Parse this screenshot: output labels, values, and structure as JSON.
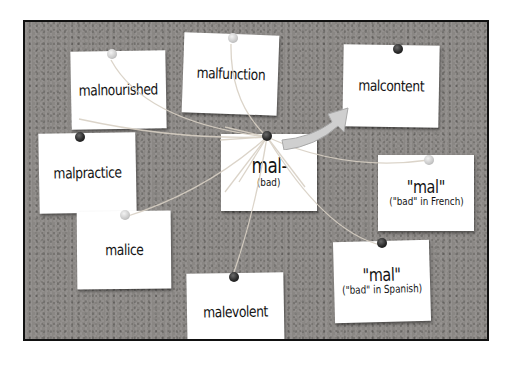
{
  "board": {
    "background_color": "#8a8784",
    "frame_color": "#111111",
    "note_color": "#ffffff",
    "string_color": "#d8d0c4"
  },
  "center_note": {
    "root": "mal-",
    "meaning": "(bad)"
  },
  "notes": [
    {
      "id": "malnourished",
      "word": "malnourished"
    },
    {
      "id": "malfunction",
      "word": "malfunction"
    },
    {
      "id": "malcontent",
      "word": "malcontent"
    },
    {
      "id": "malpractice",
      "word": "malpractice"
    },
    {
      "id": "malice",
      "word": "malice"
    },
    {
      "id": "malevolent",
      "word": "malevolent"
    }
  ],
  "origin_notes": [
    {
      "id": "french",
      "word": "\"mal\"",
      "gloss": "(\"bad\" in French)"
    },
    {
      "id": "spanish",
      "word": "\"mal\"",
      "gloss": "(\"bad\" in Spanish)"
    }
  ],
  "arrow": {
    "from": "mal-",
    "to": "malcontent",
    "color": "#c9c9c9"
  }
}
